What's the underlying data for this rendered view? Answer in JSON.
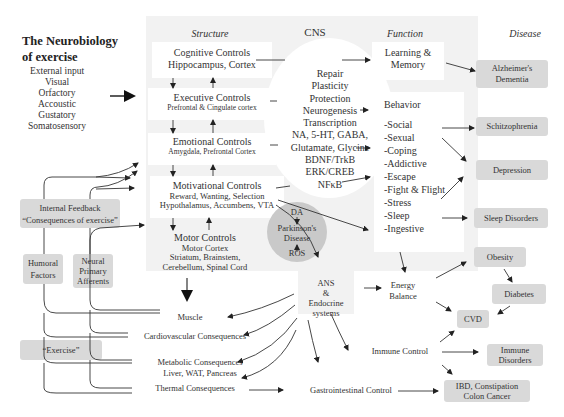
{
  "title": {
    "line1": "The Neurobiology",
    "line2": "of exercise"
  },
  "external_input": [
    "External input",
    "Visual",
    "Orfactory",
    "Accoustic",
    "Gustatory",
    "Somatosensory"
  ],
  "headers": {
    "structure": "Structure",
    "cns": "CNS",
    "function": "Function",
    "disease": "Disease"
  },
  "structure": {
    "cognitive": {
      "title": "Cognitive Controls",
      "sub": "Hippocampus, Cortex"
    },
    "executive": {
      "title": "Executive Controls",
      "sub": "Prefrontal & Cingulate cortex"
    },
    "emotional": {
      "title": "Emotional Controls",
      "sub": "Amygdala, Prefrontal Cortex"
    },
    "motivational": {
      "title": "Motivational Controls",
      "sub1": "Reward, Wanting, Selection",
      "sub2": "Hypothalamus, Accumbens, VTA"
    },
    "motor": {
      "title": "Motor Controls",
      "sub1": "Motor Cortex",
      "sub2": "Striatum, Brainstem,",
      "sub3": "Cerebellum, Spinal Cord"
    }
  },
  "cns_mechanisms": [
    "Repair",
    "Plasticity",
    "Protection",
    "Neurogenesis",
    "Transcription",
    "NA, 5-HT, GABA,",
    "Glutamate, Glycine",
    "BDNF/TrkB",
    "ERK/CREB",
    "NFκB"
  ],
  "parkinsons": {
    "top": "DA",
    "label1": "Parkinson's",
    "label2": "Disease",
    "bottom": "ROS"
  },
  "function": {
    "learning": {
      "line1": "Learning &",
      "line2": "Memory"
    },
    "behavior": {
      "title": "Behavior",
      "items": [
        "-Social",
        "-Sexual",
        "-Coping",
        "-Addictive",
        "-Escape",
        "-Fight & Flight",
        "-Stress",
        "-Sleep",
        "-Ingestive"
      ]
    }
  },
  "disease": {
    "alzheimers": {
      "line1": "Alzheimer's",
      "line2": "Dementia"
    },
    "schizophrenia": "Schitzophrenia",
    "depression": "Depression",
    "sleep": "Sleep Disorders",
    "obesity": "Obesity",
    "diabetes": "Diabetes",
    "cvd": "CVD",
    "immune": {
      "line1": "Immune",
      "line2": "Disorders"
    },
    "ibd": {
      "line1": "IBD, Constipation",
      "line2": "Colon Cancer"
    }
  },
  "feedback": {
    "internal": {
      "line1": "Internal Feedback",
      "line2": "“Consequences of exercise”"
    },
    "humoral": {
      "line1": "Humoral",
      "line2": "Factors"
    },
    "neural": {
      "line1": "Neural",
      "line2": "Primary",
      "line3": "Afferents"
    },
    "exercise": "“Exercise”"
  },
  "ans": {
    "line1": "ANS",
    "line2": "&",
    "line3": "Endocrine",
    "line4": "systems"
  },
  "energy_balance": {
    "line1": "Energy",
    "line2": "Balance"
  },
  "immune_control": "Immune Control",
  "gi_control": "Gastrointestinal Control",
  "consequences": {
    "muscle": "Muscle",
    "cardio": "Cardiovascular Consequences",
    "metabolic1": "Metabolic Consequences",
    "metabolic2": "Liver, WAT, Pancreas",
    "thermal": "Thermal Consequences"
  },
  "colors": {
    "panel": "#f2f2f2",
    "disease_box": "#d9d9d9",
    "pd_circle": "#c9c9c9",
    "line": "#333333"
  }
}
